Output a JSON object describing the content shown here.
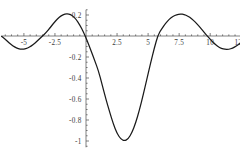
{
  "chart_data": {
    "type": "line",
    "title": "",
    "subtitle": "",
    "xlabel": "",
    "ylabel": "",
    "grid": false,
    "legend": false,
    "legend_position": "none",
    "xlim": [
      -6.8,
      13.6
    ],
    "ylim": [
      -1.06,
      0.25
    ],
    "x_ticks": [
      -5,
      -2.5,
      2.5,
      5,
      7.5,
      10,
      12.5
    ],
    "x_tick_labels": [
      "-5",
      "-2.5",
      "2.5",
      "5",
      "7.5",
      "10",
      "12.5"
    ],
    "x_minor_tick_step": 0.5,
    "y_ticks": [
      0.2,
      -0.2,
      -0.4,
      -0.6,
      -0.8,
      -1
    ],
    "y_tick_labels": [
      "0.2",
      "-0.2",
      "-0.4",
      "-0.6",
      "-0.8",
      "-1"
    ],
    "y_minor_tick_step": 0.05,
    "series": [
      {
        "name": "curve",
        "color": "#1a1a1a",
        "description": "damped oscillation, negative sinc-like lobe centered near x=2.6",
        "x": [
          -6.8,
          -6.5,
          -6.2,
          -5.9,
          -5.6,
          -5.3,
          -5.0,
          -4.7,
          -4.4,
          -4.1,
          -3.8,
          -3.5,
          -3.2,
          -2.9,
          -2.6,
          -2.3,
          -2.0,
          -1.7,
          -1.4,
          -1.1,
          -0.8,
          -0.5,
          -0.2,
          0.1,
          0.4,
          0.7,
          1.0,
          1.3,
          1.6,
          1.9,
          2.2,
          2.5,
          2.8,
          3.1,
          3.4,
          3.7,
          4.0,
          4.3,
          4.6,
          4.9,
          5.2,
          5.5,
          5.8,
          6.1,
          6.4,
          6.7,
          7.0,
          7.3,
          7.6,
          7.9,
          8.2,
          8.5,
          8.8,
          9.1,
          9.4,
          9.7,
          10.0,
          10.3,
          10.6,
          10.9,
          11.2,
          11.5,
          11.8,
          12.1,
          12.4,
          12.7,
          13.0,
          13.3,
          13.6
        ],
        "y": [
          -0.003,
          -0.031,
          -0.063,
          -0.093,
          -0.114,
          -0.126,
          -0.126,
          -0.115,
          -0.095,
          -0.067,
          -0.034,
          0.0,
          0.034,
          0.077,
          0.123,
          0.163,
          0.193,
          0.209,
          0.211,
          0.195,
          0.16,
          0.106,
          0.036,
          -0.047,
          -0.139,
          -0.234,
          -0.33,
          -0.464,
          -0.6,
          -0.722,
          -0.838,
          -0.928,
          -0.982,
          -1.0,
          -0.979,
          -0.92,
          -0.827,
          -0.706,
          -0.564,
          -0.411,
          -0.258,
          -0.115,
          0.01,
          0.07,
          0.12,
          0.159,
          0.187,
          0.204,
          0.21,
          0.205,
          0.19,
          0.165,
          0.132,
          0.094,
          0.052,
          0.009,
          -0.032,
          -0.069,
          -0.099,
          -0.119,
          -0.128,
          -0.127,
          -0.116,
          -0.096,
          -0.07,
          -0.04,
          -0.01,
          0.012,
          0.022
        ]
      }
    ],
    "annotations": [],
    "axis_origin": {
      "x": 0,
      "y": 0
    },
    "axes_drawn": [
      "x-axis at y=0",
      "y-axis at x=0"
    ],
    "minimum": {
      "x": 3.1,
      "y": -1.0
    },
    "maxima": [
      {
        "x": -1.4,
        "y": 0.211
      },
      {
        "x": 7.6,
        "y": 0.21
      }
    ]
  }
}
